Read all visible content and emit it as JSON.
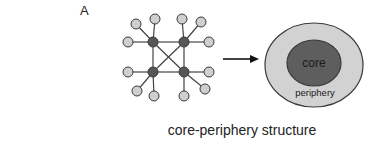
{
  "panel_label": "A",
  "caption": "core-periphery structure",
  "network": {
    "core_nodes": [
      {
        "id": "c1",
        "x": 153,
        "y": 42
      },
      {
        "id": "c2",
        "x": 184,
        "y": 42
      },
      {
        "id": "c3",
        "x": 153,
        "y": 72
      },
      {
        "id": "c4",
        "x": 184,
        "y": 72
      }
    ],
    "core_edges": [
      [
        "c1",
        "c2"
      ],
      [
        "c1",
        "c3"
      ],
      [
        "c2",
        "c4"
      ],
      [
        "c3",
        "c4"
      ],
      [
        "c1",
        "c4"
      ],
      [
        "c2",
        "c3"
      ]
    ],
    "peripheral_nodes": [
      {
        "id": "p1",
        "x": 136,
        "y": 24,
        "hub": "c1"
      },
      {
        "id": "p2",
        "x": 155,
        "y": 19,
        "hub": "c1"
      },
      {
        "id": "p3",
        "x": 128,
        "y": 42,
        "hub": "c1"
      },
      {
        "id": "p4",
        "x": 182,
        "y": 19,
        "hub": "c2"
      },
      {
        "id": "p5",
        "x": 201,
        "y": 22,
        "hub": "c2"
      },
      {
        "id": "p6",
        "x": 209,
        "y": 42,
        "hub": "c2"
      },
      {
        "id": "p7",
        "x": 128,
        "y": 72,
        "hub": "c3"
      },
      {
        "id": "p8",
        "x": 137,
        "y": 91,
        "hub": "c3"
      },
      {
        "id": "p9",
        "x": 154,
        "y": 96,
        "hub": "c3"
      },
      {
        "id": "p10",
        "x": 184,
        "y": 96,
        "hub": "c4"
      },
      {
        "id": "p11",
        "x": 205,
        "y": 89,
        "hub": "c4"
      },
      {
        "id": "p12",
        "x": 209,
        "y": 72,
        "hub": "c4"
      }
    ]
  },
  "arrow": {
    "x1": 223,
    "y1": 59,
    "x2": 259,
    "y2": 59
  },
  "schematic": {
    "outer": {
      "cx": 314,
      "cy": 65,
      "rx": 49,
      "ry": 42,
      "label": "periphery"
    },
    "inner": {
      "cx": 314,
      "cy": 63,
      "rx": 27,
      "ry": 23,
      "label": "core"
    }
  },
  "colors": {
    "core_fill": "#575757",
    "peripheral_fill": "#cfcfcf",
    "outline": "#3a3a3a",
    "edge": "#444444",
    "outer_fill": "#d2d2d2",
    "inner_fill": "#5e5e5e"
  }
}
